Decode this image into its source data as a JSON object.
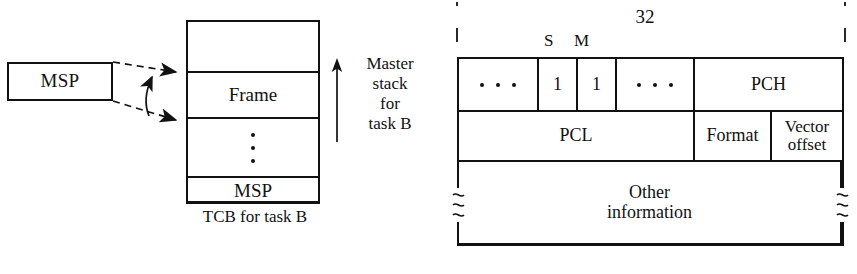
{
  "figure": {
    "left_diagram": {
      "register_box": {
        "label": "MSP"
      },
      "stack_column": {
        "caption": "TCB for task B",
        "cells": [
          {
            "label": ""
          },
          {
            "label": "Frame"
          },
          {
            "label": ""
          },
          {
            "label": "MSP"
          }
        ]
      },
      "direction_annotation": {
        "lines": [
          "Master",
          "stack",
          "for",
          "task B"
        ],
        "arrow": "up-arrow"
      }
    },
    "right_diagram": {
      "width_annotation": {
        "value": "32"
      },
      "bit_labels": [
        {
          "name": "S",
          "text": "S"
        },
        {
          "name": "M",
          "text": "M"
        }
      ],
      "rows": [
        {
          "name": "status-register-row",
          "cells": [
            {
              "name": "high-bits",
              "label": "",
              "glyph": "ellipsis"
            },
            {
              "name": "s-bit",
              "label": "1"
            },
            {
              "name": "m-bit",
              "label": "1"
            },
            {
              "name": "low-bits",
              "label": "",
              "glyph": "ellipsis"
            },
            {
              "name": "pch",
              "label": "PCH"
            }
          ]
        },
        {
          "name": "program-counter-row",
          "cells": [
            {
              "name": "pcl",
              "label": "PCL"
            },
            {
              "name": "format",
              "label": "Format"
            },
            {
              "name": "vector-offset",
              "label": "Vector\noffset"
            }
          ]
        },
        {
          "name": "other-information-row",
          "cells": [
            {
              "name": "other-information",
              "label": "Other\ninformation"
            }
          ]
        }
      ]
    }
  },
  "colors": {
    "ink": "#111111",
    "background": "#ffffff"
  }
}
